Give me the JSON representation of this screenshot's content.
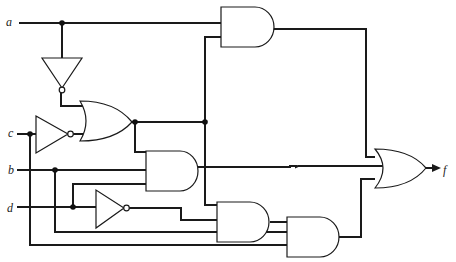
{
  "diagram": {
    "type": "logic-circuit",
    "inputs": [
      {
        "name": "a",
        "label": "a"
      },
      {
        "name": "c",
        "label": "c"
      },
      {
        "name": "b",
        "label": "b"
      },
      {
        "name": "d",
        "label": "d"
      }
    ],
    "output": {
      "name": "f",
      "label": "f"
    },
    "gates": [
      {
        "id": "not-a",
        "type": "NOT",
        "inputs": [
          "a"
        ]
      },
      {
        "id": "not-c",
        "type": "NOT",
        "inputs": [
          "c"
        ]
      },
      {
        "id": "not-d",
        "type": "NOT",
        "inputs": [
          "d"
        ]
      },
      {
        "id": "or-1",
        "type": "OR",
        "inputs": [
          "not-a",
          "not-c"
        ]
      },
      {
        "id": "and-top",
        "type": "AND",
        "inputs": [
          "a",
          "or-1"
        ]
      },
      {
        "id": "and-mid",
        "type": "AND",
        "inputs": [
          "or-1",
          "b",
          "d"
        ]
      },
      {
        "id": "and-low",
        "type": "AND",
        "inputs": [
          "or-1",
          "not-d",
          "b"
        ]
      },
      {
        "id": "and-bottom",
        "type": "AND",
        "inputs": [
          "and-low",
          "c"
        ]
      },
      {
        "id": "or-out",
        "type": "OR",
        "inputs": [
          "and-top",
          "and-mid",
          "and-bottom"
        ]
      }
    ],
    "colors": {
      "line": "#1a1a1a",
      "background": "#ffffff"
    }
  }
}
